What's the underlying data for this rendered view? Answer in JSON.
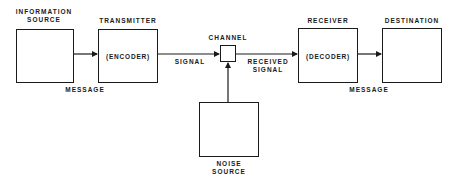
{
  "diagram": {
    "nodes": {
      "information_source": {
        "title_line1": "INFORMATION",
        "title_line2": "SOURCE",
        "inner": ""
      },
      "transmitter": {
        "title": "TRANSMITTER",
        "inner": "(ENCODER)"
      },
      "channel": {
        "title": "CHANNEL"
      },
      "receiver": {
        "title": "RECEIVER",
        "inner": "(DECODER)"
      },
      "destination": {
        "title": "DESTINATION",
        "inner": ""
      },
      "noise_source": {
        "title_line1": "NOISE",
        "title_line2": "SOURCE",
        "inner": ""
      }
    },
    "edges": {
      "source_to_transmitter": "MESSAGE",
      "transmitter_to_channel": "SIGNAL",
      "channel_to_receiver_line1": "RECEIVED",
      "channel_to_receiver_line2": "SIGNAL",
      "receiver_to_destination": "MESSAGE",
      "noise_to_channel": ""
    },
    "colors": {
      "ink": "#1a1a1a",
      "background": "#ffffff"
    }
  }
}
